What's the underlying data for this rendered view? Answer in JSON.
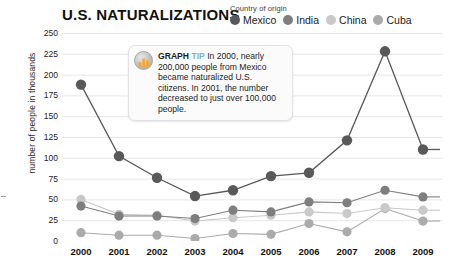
{
  "header": {
    "title": "U.S. NATURALIZATIONS"
  },
  "legend": {
    "title": "Country of origin",
    "items": [
      {
        "label": "Mexico",
        "color": "#595959"
      },
      {
        "label": "India",
        "color": "#7e7e7e"
      },
      {
        "label": "China",
        "color": "#c9c9c9"
      },
      {
        "label": "Cuba",
        "color": "#ababab"
      }
    ]
  },
  "tooltip": {
    "icon": "bar-chart-icon",
    "kicker": "GRAPH",
    "kicker2": "TIP",
    "body": "In 2000, nearly 200,000 people from Mexico became naturalized U.S. citizens. In 2001, the number decreased to just over 100,000 people."
  },
  "chart_data": {
    "type": "line",
    "title": "U.S. NATURALIZATIONS",
    "xlabel": "",
    "ylabel": "number of people in thousands",
    "ylim": [
      0,
      250
    ],
    "ytick_step": 25,
    "yticks": [
      250,
      225,
      200,
      175,
      150,
      125,
      100,
      75,
      50,
      25,
      0
    ],
    "grid": true,
    "legend_position": "top-right",
    "categories": [
      2000,
      2001,
      2002,
      2003,
      2004,
      2005,
      2006,
      2007,
      2008,
      2009
    ],
    "x_tick_labels": [
      "2000",
      "2001",
      "2002",
      "2003",
      "2004",
      "2005",
      "2006",
      "2007",
      "2008",
      "2009"
    ],
    "series": [
      {
        "name": "Mexico",
        "color": "#595959",
        "values": [
          188,
          102,
          76,
          54,
          61,
          78,
          82,
          121,
          228,
          110
        ]
      },
      {
        "name": "India",
        "color": "#7e7e7e",
        "values": [
          42,
          30,
          30,
          27,
          37,
          35,
          47,
          46,
          61,
          53
        ]
      },
      {
        "name": "China",
        "color": "#c9c9c9",
        "values": [
          50,
          32,
          31,
          24,
          28,
          31,
          35,
          33,
          40,
          37
        ]
      },
      {
        "name": "Cuba",
        "color": "#ababab",
        "values": [
          10,
          7,
          7,
          3,
          9,
          8,
          21,
          11,
          39,
          24
        ]
      }
    ]
  }
}
